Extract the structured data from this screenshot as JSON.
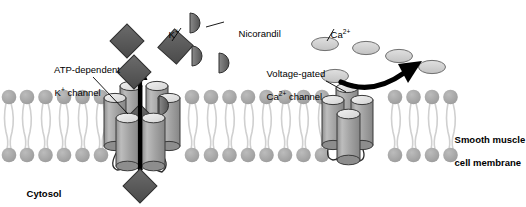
{
  "figure": {
    "background_color": "#ffffff"
  },
  "colors": {
    "membrane_head": "#a8a8a8",
    "membrane_tail": "#d8d8d8",
    "potassium_ion": "#595959",
    "nicorandil": "#666666",
    "calcium_ion": "#cfcfcf",
    "channel_body": "#a0a0a0",
    "channel_cap": "#e3e3e3",
    "arrow": "#000000",
    "text": "#000000"
  },
  "labels": {
    "atp_channel": {
      "line1": "ATP-dependent",
      "line2_prefix": "K",
      "line2_sup": "+",
      "line2_suffix": " channel",
      "bold": false
    },
    "nicorandil": {
      "text": "Nicorandil",
      "bold": false
    },
    "voltage_channel": {
      "line1": "Voltage-gated",
      "line2_prefix": "Ca",
      "line2_sup": "2+",
      "line2_suffix": " channel",
      "bold": false
    },
    "smooth_muscle": {
      "line1": "Smooth muscle",
      "line2": "cell membrane",
      "bold": true
    },
    "cytosol": {
      "text": "Cytosol",
      "bold": true
    },
    "potassium_ion": {
      "prefix": "K",
      "sup": "+"
    },
    "calcium_ion": {
      "prefix": "Ca",
      "sup": "2+"
    }
  },
  "diagram": {
    "membrane": {
      "name": "phospholipid-bilayer",
      "x_start": 4,
      "x_end": 466,
      "head_radius": 7.2,
      "upper_head_cy": 97,
      "lower_head_cy": 154,
      "spacing": 18.4
    },
    "potassium_channel": {
      "name": "atp-dependent-potassium-channel",
      "center_x": 140,
      "center_y": 128,
      "subunit_count": 6,
      "state": "open",
      "bound_ligand": "nicorandil",
      "transport_direction": "outward",
      "arrow": {
        "x": 140,
        "y_top": 68,
        "y_bottom": 196
      }
    },
    "calcium_channel": {
      "name": "voltage-gated-calcium-channel",
      "center_x": 350,
      "center_y": 128,
      "subunit_count": 5,
      "state": "closed",
      "transport_direction": "blocked"
    },
    "potassium_ions": [
      {
        "x": 128,
        "y": 42,
        "size": 13,
        "location": "extracellular"
      },
      {
        "x": 175,
        "y": 47,
        "size": 14,
        "location": "extracellular"
      },
      {
        "x": 134,
        "y": 72,
        "size": 13,
        "location": "extracellular"
      },
      {
        "x": 140,
        "y": 117,
        "size": 13,
        "location": "channel-pore"
      },
      {
        "x": 140,
        "y": 186,
        "size": 13,
        "location": "cytosol"
      }
    ],
    "nicorandil_molecules": [
      {
        "x": 197,
        "y": 23,
        "r": 9,
        "location": "extracellular"
      },
      {
        "x": 199,
        "y": 56,
        "r": 9,
        "location": "extracellular"
      },
      {
        "x": 226,
        "y": 63,
        "r": 9,
        "location": "extracellular"
      },
      {
        "x": 168,
        "y": 105,
        "r": 9,
        "location": "bound-to-channel"
      }
    ],
    "calcium_ions": [
      {
        "x": 325,
        "y": 44,
        "rx": 13,
        "ry": 6.5
      },
      {
        "x": 366,
        "y": 48,
        "rx": 13,
        "ry": 6.5
      },
      {
        "x": 398,
        "y": 55,
        "rx": 13,
        "ry": 6.5
      },
      {
        "x": 430,
        "y": 67,
        "rx": 13,
        "ry": 6.5
      },
      {
        "x": 335,
        "y": 74,
        "rx": 13,
        "ry": 6.5
      },
      {
        "x": 350,
        "y": 98,
        "rx": 14,
        "ry": 7
      }
    ],
    "curved_arrow": {
      "name": "calcium-deflection-arrow",
      "from_x": 340,
      "from_y": 80,
      "to_x": 423,
      "to_y": 62
    },
    "leader_lines": [
      {
        "name": "atp-channel-leader",
        "x1": 93,
        "y1": 77,
        "x2": 126,
        "y2": 112
      },
      {
        "name": "nicorandil-leader",
        "x1": 205,
        "y1": 28,
        "x2": 222,
        "y2": 22
      },
      {
        "name": "potassium-leader",
        "x1": 172,
        "y1": 42,
        "x2": 180,
        "y2": 30
      },
      {
        "name": "calcium-leader",
        "x1": 327,
        "y1": 42,
        "x2": 333,
        "y2": 30
      },
      {
        "name": "voltage-channel-leader",
        "x1": 327,
        "y1": 82,
        "x2": 345,
        "y2": 92
      }
    ]
  }
}
